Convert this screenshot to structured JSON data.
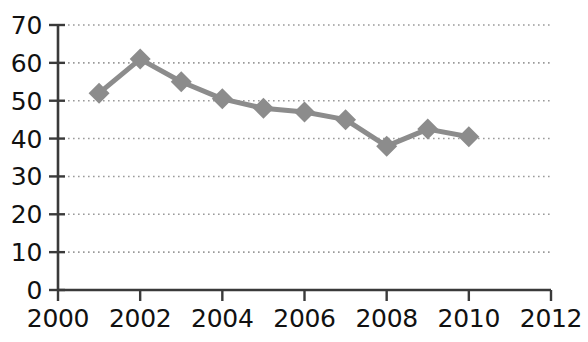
{
  "chart_data": {
    "type": "line",
    "title": "",
    "subtitle": "",
    "xlabel": "",
    "ylabel": "",
    "x": [
      2001,
      2002,
      2003,
      2004,
      2005,
      2006,
      2007,
      2008,
      2009,
      2010
    ],
    "values": [
      52,
      61,
      55,
      50.5,
      48,
      47,
      45,
      38,
      42.5,
      40.5
    ],
    "series": [
      {
        "name": "",
        "values": [
          52,
          61,
          55,
          50.5,
          48,
          47,
          45,
          38,
          42.5,
          40.5
        ]
      }
    ],
    "xlim": [
      2000,
      2012
    ],
    "ylim": [
      0,
      70
    ],
    "x_ticks": [
      2000,
      2002,
      2004,
      2006,
      2008,
      2010,
      2012
    ],
    "x_tick_labels": [
      "2000",
      "2002",
      "2004",
      "2006",
      "2008",
      "2010",
      "2012"
    ],
    "x_minor_tick_step": 1,
    "y_ticks": [
      0,
      10,
      20,
      30,
      40,
      50,
      60,
      70
    ],
    "y_tick_labels": [
      "0",
      "10",
      "20",
      "30",
      "40",
      "50",
      "60",
      "70"
    ],
    "grid": "horizontal-dotted",
    "legend": "none",
    "annotations": [],
    "marker": "diamond",
    "colors": {
      "line": "#8c8c8c",
      "marker": "#8c8c8c",
      "axis": "#3a3a3a",
      "grid": "#9a9a9a",
      "text": "#111111",
      "background": "#ffffff"
    }
  }
}
